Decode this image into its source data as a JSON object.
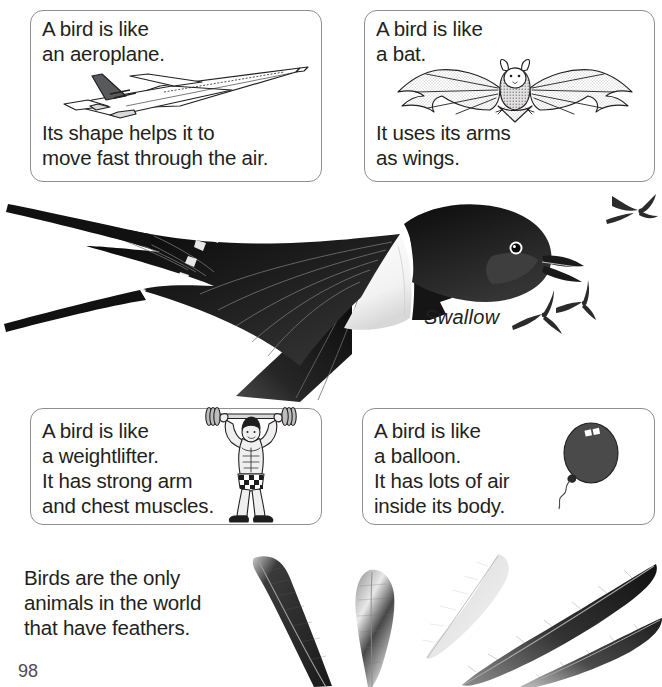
{
  "page": {
    "number": "98",
    "background_color": "#ffffff",
    "text_color": "#231f20",
    "box_border_color": "#8d8f92"
  },
  "boxes": [
    {
      "id": "aeroplane",
      "comparison": "aeroplane",
      "text_top": "A bird is like\nan aeroplane.",
      "text_bottom": "Its shape helps it to\nmove fast through the air.",
      "illustration": "aeroplane-illustration"
    },
    {
      "id": "bat",
      "comparison": "bat",
      "text_top": "A bird is like\na bat.",
      "text_bottom": "It uses its arms\nas wings.",
      "illustration": "bat-illustration"
    },
    {
      "id": "weightlifter",
      "comparison": "weightlifter",
      "text_top": "A bird is like\na weightlifter.\nIt has strong arm\nand chest muscles.",
      "text_bottom": "",
      "illustration": "weightlifter-illustration"
    },
    {
      "id": "balloon",
      "comparison": "balloon",
      "text_top": "A bird is like\na balloon.\nIt has lots of air\ninside its body.",
      "text_bottom": "",
      "illustration": "balloon-illustration"
    }
  ],
  "main_illustration": {
    "label": "Swallow",
    "subject": "swallow-bird-in-flight",
    "small_birds_count": 3
  },
  "feather_note": {
    "text": "Birds are the only\nanimals in the world\nthat have feathers."
  },
  "feathers": {
    "count": 5,
    "description": "five-bird-feathers"
  },
  "colors": {
    "balloon": "#4a4a4a",
    "balloon_highlight": "#ffffff",
    "bird_dark": "#1a1a1a",
    "bird_light": "#ffffff",
    "feather_dark": "#2b2b2b",
    "feather_light": "#d4d4d4"
  }
}
